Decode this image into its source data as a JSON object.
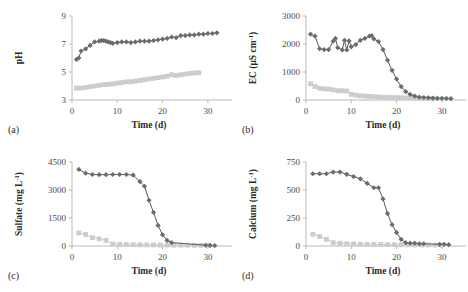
{
  "figure": {
    "background": "#ffffff",
    "series_colors": {
      "dark_diamond": "#6b6b6b",
      "light_square": "#cccccc"
    },
    "panels": [
      {
        "tag": "(a)",
        "name": "ph"
      },
      {
        "tag": "(b)",
        "name": "ec"
      },
      {
        "tag": "(c)",
        "name": "sulfate"
      },
      {
        "tag": "(d)",
        "name": "calcium"
      }
    ]
  },
  "chart_data": [
    {
      "type": "line",
      "panel": "(a)",
      "title": "",
      "xlabel": "Time (d)",
      "ylabel": "pH",
      "ylabel_plain": "pH",
      "xlim": [
        0,
        34
      ],
      "ylim": [
        3,
        9
      ],
      "xticks": [
        0,
        10,
        20,
        30
      ],
      "yticks": [
        3,
        5,
        7,
        9
      ],
      "grid": false,
      "legend": "none",
      "series": [
        {
          "name": "dark-diamond-series",
          "marker": "diamond",
          "color": "#6b6b6b",
          "x": [
            1,
            1.5,
            2,
            3,
            4,
            5,
            6,
            6.5,
            7,
            7.5,
            8,
            8.5,
            9,
            10,
            11,
            12,
            13,
            14,
            15,
            16,
            17,
            18,
            19,
            20,
            21,
            22,
            23,
            24,
            25,
            26,
            27,
            28,
            29,
            30,
            31,
            32
          ],
          "values": [
            5.9,
            6.0,
            6.5,
            6.65,
            6.9,
            7.15,
            7.2,
            7.25,
            7.25,
            7.2,
            7.15,
            7.1,
            7.05,
            7.1,
            7.15,
            7.15,
            7.1,
            7.15,
            7.2,
            7.2,
            7.2,
            7.25,
            7.3,
            7.35,
            7.4,
            7.5,
            7.45,
            7.6,
            7.6,
            7.65,
            7.65,
            7.7,
            7.7,
            7.75,
            7.75,
            7.8
          ]
        },
        {
          "name": "light-square-series",
          "marker": "square",
          "color": "#cccccc",
          "x": [
            1,
            2,
            3,
            4,
            5,
            6,
            7,
            8,
            9,
            10,
            11,
            12,
            13,
            14,
            15,
            16,
            17,
            18,
            19,
            20,
            21,
            22,
            23,
            24,
            25,
            26,
            27,
            28
          ],
          "values": [
            3.85,
            3.85,
            3.9,
            3.95,
            4.0,
            4.05,
            4.1,
            4.12,
            4.15,
            4.2,
            4.25,
            4.3,
            4.3,
            4.35,
            4.4,
            4.45,
            4.5,
            4.55,
            4.6,
            4.65,
            4.7,
            4.8,
            4.75,
            4.8,
            4.85,
            4.9,
            4.92,
            4.95
          ]
        }
      ]
    },
    {
      "type": "line",
      "panel": "(b)",
      "title": "",
      "xlabel": "Time (d)",
      "ylabel": "EC (μS cm⁻¹)",
      "ylabel_plain": "EC (uS cm-1)",
      "xlim": [
        0,
        34
      ],
      "ylim": [
        0,
        3000
      ],
      "xticks": [
        0,
        10,
        20,
        30
      ],
      "yticks": [
        0,
        1000,
        2000,
        3000
      ],
      "grid": false,
      "legend": "none",
      "series": [
        {
          "name": "dark-diamond-series",
          "marker": "diamond",
          "color": "#6b6b6b",
          "x": [
            1,
            2,
            3,
            4,
            5,
            6,
            6.5,
            7,
            8,
            8.5,
            9,
            9.5,
            10,
            11,
            12,
            13,
            14,
            14.5,
            15,
            16,
            17,
            18,
            19,
            20,
            21,
            22,
            23,
            24,
            25,
            26,
            27,
            28,
            29,
            30,
            31,
            32
          ],
          "values": [
            2350,
            2280,
            1830,
            1800,
            1800,
            2100,
            2200,
            1870,
            1790,
            2130,
            1790,
            2110,
            1900,
            1980,
            2130,
            2200,
            2280,
            2300,
            2180,
            2090,
            1800,
            1420,
            1060,
            750,
            480,
            300,
            200,
            140,
            100,
            90,
            80,
            70,
            60,
            60,
            55,
            50
          ]
        },
        {
          "name": "light-square-series",
          "marker": "square",
          "color": "#cccccc",
          "x": [
            1,
            2,
            3,
            4,
            5,
            6,
            7,
            8,
            9,
            10,
            11,
            12,
            13,
            14,
            15,
            16,
            17,
            18,
            19,
            20,
            21,
            22,
            23,
            24,
            25,
            26,
            27,
            28
          ],
          "values": [
            580,
            480,
            420,
            400,
            390,
            360,
            330,
            330,
            320,
            200,
            170,
            150,
            140,
            130,
            120,
            110,
            100,
            95,
            90,
            85,
            80,
            75,
            70,
            65,
            60,
            55,
            50,
            45
          ]
        }
      ]
    },
    {
      "type": "line",
      "panel": "(c)",
      "title": "",
      "xlabel": "Time (d)",
      "ylabel": "Sulfate (mg L⁻¹)",
      "ylabel_plain": "Sulfate (mg L-1)",
      "xlim": [
        0,
        34
      ],
      "ylim": [
        0,
        4500
      ],
      "xticks": [
        0,
        10,
        20,
        30
      ],
      "yticks": [
        0,
        1500,
        3000,
        4500
      ],
      "grid": false,
      "legend": "none",
      "series": [
        {
          "name": "dark-diamond-series",
          "marker": "diamond",
          "color": "#6b6b6b",
          "x": [
            1.5,
            3,
            4.5,
            6,
            7.5,
            9,
            10.5,
            12,
            13.5,
            15,
            16,
            17,
            18,
            19,
            20,
            21,
            22,
            29.5,
            30.5,
            31.5
          ],
          "values": [
            4100,
            3900,
            3830,
            3820,
            3820,
            3830,
            3830,
            3830,
            3800,
            3450,
            3200,
            2450,
            1800,
            1100,
            600,
            300,
            180,
            40,
            30,
            25
          ]
        },
        {
          "name": "light-square-series",
          "marker": "square",
          "color": "#cccccc",
          "x": [
            1.5,
            3,
            4.5,
            6,
            7.5,
            9,
            10.5,
            12,
            13.5,
            15,
            16.5,
            18,
            19.5,
            21,
            22.5,
            24,
            25.5,
            27,
            28.5,
            30
          ],
          "values": [
            700,
            620,
            450,
            380,
            300,
            110,
            90,
            80,
            70,
            65,
            60,
            55,
            50,
            50,
            45,
            45,
            40,
            40,
            35,
            35
          ]
        }
      ]
    },
    {
      "type": "line",
      "panel": "(d)",
      "title": "",
      "xlabel": "Time (d)",
      "ylabel": "Calcium (mg L⁻¹)",
      "ylabel_plain": "Calcium (mg L-1)",
      "xlim": [
        0,
        34
      ],
      "ylim": [
        0,
        750
      ],
      "xticks": [
        0,
        10,
        20,
        30
      ],
      "yticks": [
        0,
        250,
        500,
        750
      ],
      "grid": false,
      "legend": "none",
      "series": [
        {
          "name": "dark-diamond-series",
          "marker": "diamond",
          "color": "#6b6b6b",
          "x": [
            1.5,
            3,
            4.5,
            6,
            7.5,
            9,
            10.5,
            12,
            13.5,
            15,
            16,
            17,
            18,
            19,
            20,
            21,
            22,
            23,
            24,
            25,
            26,
            29.5,
            30.5,
            31.5
          ],
          "values": [
            645,
            645,
            645,
            660,
            660,
            640,
            620,
            600,
            560,
            520,
            520,
            420,
            290,
            190,
            120,
            60,
            30,
            25,
            25,
            20,
            20,
            15,
            15,
            12
          ]
        },
        {
          "name": "light-square-series",
          "marker": "square",
          "color": "#cccccc",
          "x": [
            1.5,
            3,
            4.5,
            6,
            7.5,
            9,
            10.5,
            12,
            13.5,
            15,
            16.5,
            18,
            19.5,
            21,
            22.5,
            24,
            25.5,
            27,
            28.5,
            30
          ],
          "values": [
            105,
            85,
            60,
            30,
            25,
            20,
            18,
            16,
            15,
            14,
            13,
            12,
            12,
            11,
            10,
            10,
            9,
            9,
            8,
            8
          ]
        }
      ]
    }
  ]
}
